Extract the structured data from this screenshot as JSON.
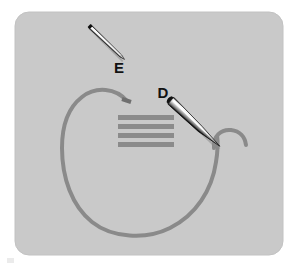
{
  "figure": {
    "canvas": {
      "width": 296,
      "height": 270
    },
    "background_color": "#ffffff",
    "panel": {
      "name": "photo-panel",
      "fill_color": "#c9c9c9",
      "edge_color": "#c2c2c2",
      "x": 15,
      "y": 12,
      "width": 268,
      "height": 243,
      "corner_radius": 14
    },
    "labels": [
      {
        "id": "label-e",
        "text": "E",
        "x": 119,
        "y": 73,
        "color": "#121212",
        "describes": "thin straight needle, upper left"
      },
      {
        "id": "label-d",
        "text": "D",
        "x": 163,
        "y": 98,
        "color": "#121212",
        "describes": "tapered needle holding thread, center right"
      }
    ],
    "needles": [
      {
        "id": "needle-e",
        "label": "E",
        "kind": "straight-thin-needle",
        "from": [
          90,
          26
        ],
        "to": [
          125,
          59
        ],
        "body_color": "#e9e9e9",
        "outline_color": "#111111",
        "shadow_color": "#8f8f8f",
        "max_width": 3
      },
      {
        "id": "needle-d",
        "label": "D",
        "kind": "tapered-needle",
        "from": [
          170,
          100
        ],
        "to": [
          233,
          156
        ],
        "body_color": "#f2f2f2",
        "outline_color": "#101010",
        "shadow_color": "#6f6f6f",
        "max_width": 9
      }
    ],
    "thread": {
      "id": "suture-thread",
      "color": "#8a8a8a",
      "stroke_width": 4,
      "free_end": [
        127,
        101
      ],
      "description": "long gray suture loop sweeping from a cut free end near the stitches, arcing left, down around a wide U, and back up to a small hook near needle D"
    },
    "thread_hook": {
      "id": "thread-hook",
      "color": "#8a8a8a",
      "stroke_width": 4,
      "description": "small hooked curl of thread to the right of needle D tip"
    },
    "stitches": {
      "id": "stitch-bars",
      "color": "#8b8b8b",
      "count": 4,
      "x": 118,
      "width": 56,
      "bar_height": 5,
      "y_positions": [
        115,
        124,
        133,
        142
      ]
    }
  }
}
